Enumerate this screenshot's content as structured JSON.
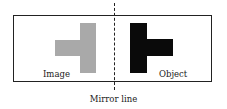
{
  "diagram": {
    "type": "mirror-reflection",
    "labels": {
      "left": "Image",
      "right": "Object",
      "caption": "Mirror line"
    },
    "colors": {
      "image_fill": "#a9a9a9",
      "object_fill": "#0a0a0a",
      "frame_stroke": "#222222",
      "mirror_line_stroke": "#222222"
    },
    "shapes": {
      "image": {
        "description": "T-shape (tetromino) with arm pointing left",
        "fill": "gray"
      },
      "object": {
        "description": "T-shape (tetromino) with arm pointing right",
        "fill": "black"
      }
    },
    "mirror_line": {
      "style": "dashed",
      "orientation": "vertical"
    }
  }
}
